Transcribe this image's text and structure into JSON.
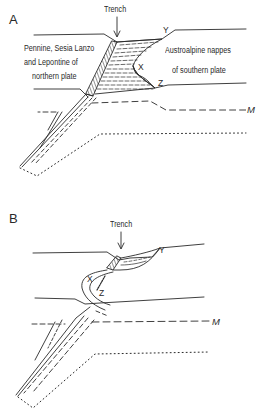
{
  "panels": [
    {
      "id": "A",
      "letter": "A",
      "trench_label": "Trench",
      "northern_plate": {
        "line1": "Pennine, Sesia Lanzo",
        "line2": "and  Lepontine of",
        "line3": "northern plate"
      },
      "southern_plate": {
        "line1": "Austroalpine nappes",
        "line2": "of southern plate"
      },
      "points": {
        "x": "X",
        "y": "Y",
        "z": "Z"
      },
      "moho_label": "M"
    },
    {
      "id": "B",
      "letter": "B",
      "trench_label": "Trench",
      "points": {
        "x": "X",
        "y": "Y",
        "z": "Z"
      },
      "moho_label": "M"
    }
  ],
  "colors": {
    "ink": "#2a2a2a",
    "background": "#ffffff"
  }
}
